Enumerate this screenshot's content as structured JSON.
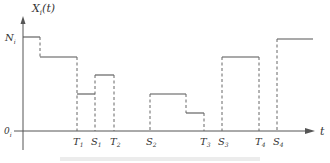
{
  "diagram": {
    "y_axis_label": {
      "main": "X",
      "sub": "i",
      "arg": "(t)"
    },
    "x_axis_label": "t",
    "y_ticks": [
      {
        "main": "N",
        "sub": "i",
        "y": 37
      },
      {
        "main": "0",
        "sub": "i",
        "y": 131
      }
    ],
    "x_ticks": [
      {
        "main": "T",
        "sub": "1",
        "x": 77
      },
      {
        "main": "S",
        "sub": "1",
        "x": 95
      },
      {
        "main": "T",
        "sub": "2",
        "x": 114
      },
      {
        "main": "S",
        "sub": "2",
        "x": 150
      },
      {
        "main": "T",
        "sub": "3",
        "x": 204
      },
      {
        "main": "S",
        "sub": "3",
        "x": 222
      },
      {
        "main": "T",
        "sub": "4",
        "x": 259
      },
      {
        "main": "S",
        "sub": "4",
        "x": 277
      }
    ],
    "steps": [
      {
        "x1": 23,
        "x2": 40,
        "y": 37
      },
      {
        "x1": 40,
        "x2": 77,
        "y": 57
      },
      {
        "x1": 77,
        "x2": 95,
        "y": 94
      },
      {
        "x1": 95,
        "x2": 114,
        "y": 75
      },
      {
        "x1": 150,
        "x2": 186,
        "y": 94
      },
      {
        "x1": 186,
        "x2": 204,
        "y": 113
      },
      {
        "x1": 222,
        "x2": 259,
        "y": 57
      },
      {
        "x1": 277,
        "x2": 313,
        "y": 39
      }
    ],
    "dashed": [
      {
        "x": 40,
        "y1": 37,
        "y2": 57
      },
      {
        "x": 77,
        "y1": 57,
        "y2": 131
      },
      {
        "x": 95,
        "y1": 75,
        "y2": 131
      },
      {
        "x": 114,
        "y1": 75,
        "y2": 131
      },
      {
        "x": 150,
        "y1": 94,
        "y2": 131
      },
      {
        "x": 186,
        "y1": 94,
        "y2": 113
      },
      {
        "x": 204,
        "y1": 113,
        "y2": 131
      },
      {
        "x": 222,
        "y1": 57,
        "y2": 131
      },
      {
        "x": 259,
        "y1": 57,
        "y2": 131
      },
      {
        "x": 277,
        "y1": 39,
        "y2": 131
      }
    ],
    "colors": {
      "line": "#555555",
      "axis": "#555555",
      "caption": "#d0d0d0"
    }
  }
}
